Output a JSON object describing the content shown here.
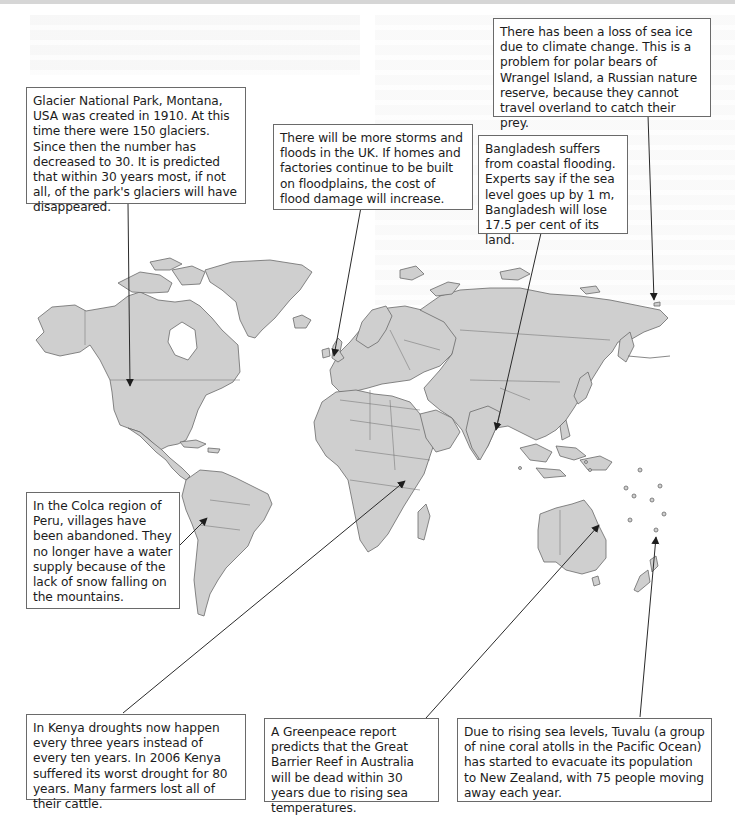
{
  "figure": {
    "type": "annotated-world-map",
    "map_fill": "#cfcfcf",
    "map_stroke": "#6a6a6a",
    "box_border": "#6a6a6a",
    "arrow_color": "#2a2a2a"
  },
  "annotations": [
    {
      "id": "glacier",
      "text": "Glacier National Park, Montana, USA was created in 1910. At this time there were 150 glaciers. Since then the number has decreased to 30. It is predicted that within 30 years most, if not all, of the park's glaciers will have disappeared.",
      "target": "Montana, USA"
    },
    {
      "id": "uk",
      "text": "There will be more storms and floods in the UK. If homes and factories continue to be built on floodplains, the cost of flood damage will increase.",
      "target": "United Kingdom"
    },
    {
      "id": "wrangel",
      "text": "There has been a loss of sea ice due to climate change. This is a problem for polar bears of Wrangel Island, a Russian nature reserve, because they cannot travel overland to catch their prey.",
      "target": "Wrangel Island"
    },
    {
      "id": "bangladesh",
      "text": "Bangladesh suffers from coastal flooding. Experts say if the sea level goes up by 1 m, Bangladesh will lose 17.5 per cent of its land.",
      "target": "Bangladesh"
    },
    {
      "id": "peru",
      "text": "In the Colca region of Peru, villages have been abandoned. They no longer have a water supply because of the lack of snow falling on the mountains.",
      "target": "Peru"
    },
    {
      "id": "kenya",
      "text": "In Kenya droughts now happen every three years instead of every ten years. In 2006 Kenya suffered its worst drought for 80 years. Many farmers lost all of their cattle.",
      "target": "Kenya"
    },
    {
      "id": "reef",
      "text": "A Greenpeace report predicts that the Great Barrier Reef in Australia will be dead within 30 years due to rising sea temperatures.",
      "target": "Great Barrier Reef"
    },
    {
      "id": "tuvalu",
      "text": "Due to rising sea levels, Tuvalu (a group of nine coral atolls in the Pacific Ocean) has started to evacuate its population to New Zealand, with 75 people moving away each year.",
      "target": "Tuvalu"
    }
  ]
}
